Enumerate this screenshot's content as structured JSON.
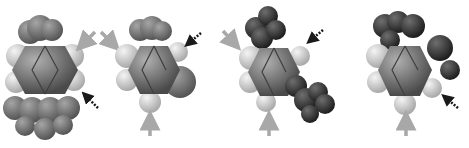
{
  "figure": {
    "colors": {
      "background": "#ffffff",
      "hydrogen": "#d4d4d4",
      "carbon_ring": "#8a8a8a",
      "methyl_light": "#7e7e7e",
      "substituent_dark": "#3c3c3c",
      "arrow_solid": "#a8a8a8",
      "arrow_dotted": "#1a1a1a"
    },
    "molecules": [
      {
        "id": "molecule-1",
        "center_x": 47,
        "center_y": 75
      },
      {
        "id": "molecule-2",
        "center_x": 150,
        "center_y": 68
      },
      {
        "id": "molecule-3",
        "center_x": 270,
        "center_y": 70
      },
      {
        "id": "molecule-4",
        "center_x": 405,
        "center_y": 65
      }
    ]
  }
}
